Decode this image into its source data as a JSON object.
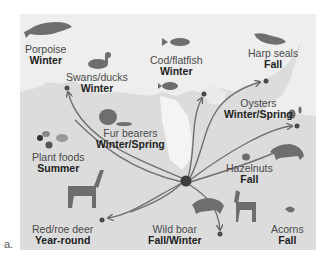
{
  "figure_label": "a.",
  "colors": {
    "panel_bg": "#eeeeee",
    "land": "#dcdcdc",
    "sea_light": "#f6f6f6",
    "icon": "#6e6e6e",
    "arrow": "#707070",
    "hub": "#3d3d3d"
  },
  "hub": {
    "x": 186,
    "y": 181
  },
  "resources": [
    {
      "id": "porpoise",
      "name": "Porpoise",
      "season": "Winter",
      "icon": "porpoise-icon"
    },
    {
      "id": "swans",
      "name": "Swans/ducks",
      "season": "Winter",
      "icon": "duck-icon"
    },
    {
      "id": "cod",
      "name": "Cod/flatfish",
      "season": "Winter",
      "icon": "fish-icon"
    },
    {
      "id": "seals",
      "name": "Harp seals",
      "season": "Fall",
      "icon": "seal-icon"
    },
    {
      "id": "fur",
      "name": "Fur bearers",
      "season": "Winter/Spring",
      "icon": "beaver-icon"
    },
    {
      "id": "oysters",
      "name": "Oysters",
      "season": "Winter/Spring",
      "icon": "oyster-icon"
    },
    {
      "id": "plants",
      "name": "Plant foods",
      "season": "Summer",
      "icon": "plant-icon"
    },
    {
      "id": "hazelnuts",
      "name": "Hazelnuts",
      "season": "Fall",
      "icon": "hazelnut-icon"
    },
    {
      "id": "deer",
      "name": "Red/roe deer",
      "season": "Year-round",
      "icon": "deer-icon"
    },
    {
      "id": "boar",
      "name": "Wild boar",
      "season": "Fall/Winter",
      "icon": "boar-icon"
    },
    {
      "id": "acorns",
      "name": "Acorns",
      "season": "Fall",
      "icon": "acorn-icon"
    }
  ]
}
